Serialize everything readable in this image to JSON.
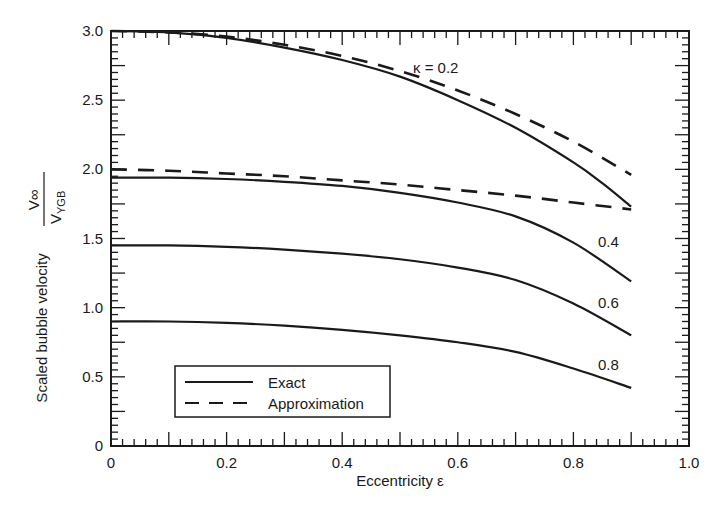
{
  "chart_data": {
    "type": "line",
    "title": "",
    "xlabel": "Eccentricity ε",
    "ylabel": "Scaled bubble velocity",
    "ylabel_fraction": {
      "numerator": "V∞",
      "denominator": "VYGB"
    },
    "xlim": [
      0,
      1.0
    ],
    "ylim": [
      0,
      3.0
    ],
    "x_ticks": [
      "0",
      "0.2",
      "0.4",
      "0.6",
      "0.8",
      "1.0"
    ],
    "y_ticks": [
      "0",
      "0.5",
      "1.0",
      "1.5",
      "2.0",
      "2.5",
      "3.0"
    ],
    "grid": false,
    "legend_position": "lower left",
    "legend": [
      {
        "label": "Exact",
        "style": "solid"
      },
      {
        "label": "Approximation",
        "style": "dashed"
      }
    ],
    "series": [
      {
        "name": "Exact κ=0.2",
        "kappa": "0.2",
        "style": "solid",
        "x": [
          0,
          0.1,
          0.2,
          0.3,
          0.4,
          0.5,
          0.6,
          0.7,
          0.8,
          0.85,
          0.9
        ],
        "y": [
          3.0,
          2.99,
          2.95,
          2.88,
          2.79,
          2.67,
          2.5,
          2.3,
          2.05,
          1.9,
          1.73
        ]
      },
      {
        "name": "Approximation κ=0.2",
        "kappa": "0.2",
        "style": "dashed",
        "x": [
          0,
          0.1,
          0.2,
          0.3,
          0.4,
          0.5,
          0.6,
          0.7,
          0.8,
          0.9
        ],
        "y": [
          3.0,
          2.99,
          2.96,
          2.9,
          2.82,
          2.71,
          2.57,
          2.4,
          2.2,
          1.96
        ]
      },
      {
        "name": "Approximation κ=0.4",
        "kappa": "0.4",
        "style": "dashed",
        "x": [
          0,
          0.1,
          0.2,
          0.3,
          0.4,
          0.5,
          0.6,
          0.7,
          0.8,
          0.9
        ],
        "y": [
          2.0,
          1.99,
          1.97,
          1.95,
          1.92,
          1.89,
          1.85,
          1.81,
          1.76,
          1.71
        ]
      },
      {
        "name": "Exact κ=0.4",
        "kappa": "0.4",
        "style": "solid",
        "x": [
          0,
          0.1,
          0.2,
          0.3,
          0.4,
          0.5,
          0.6,
          0.7,
          0.8,
          0.9
        ],
        "y": [
          1.94,
          1.94,
          1.93,
          1.91,
          1.88,
          1.83,
          1.76,
          1.66,
          1.47,
          1.19
        ]
      },
      {
        "name": "Exact κ=0.6",
        "kappa": "0.6",
        "style": "solid",
        "x": [
          0,
          0.1,
          0.2,
          0.3,
          0.4,
          0.5,
          0.6,
          0.7,
          0.8,
          0.9
        ],
        "y": [
          1.45,
          1.45,
          1.44,
          1.42,
          1.39,
          1.35,
          1.29,
          1.2,
          1.03,
          0.8
        ]
      },
      {
        "name": "Exact κ=0.8",
        "kappa": "0.8",
        "style": "solid",
        "x": [
          0,
          0.1,
          0.2,
          0.3,
          0.4,
          0.5,
          0.6,
          0.7,
          0.8,
          0.9
        ],
        "y": [
          0.9,
          0.9,
          0.89,
          0.87,
          0.84,
          0.8,
          0.75,
          0.68,
          0.56,
          0.42
        ]
      }
    ],
    "annotations": [
      {
        "text": "κ = 0.2",
        "x": 0.52,
        "y": 2.68
      },
      {
        "text": "0.4",
        "x": 0.84,
        "y": 1.56
      },
      {
        "text": "0.6",
        "x": 0.84,
        "y": 1.08
      },
      {
        "text": "0.8",
        "x": 0.84,
        "y": 0.58
      }
    ]
  },
  "labels": {
    "xlabel": "Eccentricity ε",
    "ylabel": "Scaled bubble velocity",
    "ylabel_num": "V∞",
    "ylabel_den_v": "V",
    "ylabel_den_sub": "YGB",
    "ann_02": "κ = 0.2",
    "ann_04": "0.4",
    "ann_06": "0.6",
    "ann_08": "0.8",
    "legend_exact": "Exact",
    "legend_approx": "Approximation"
  }
}
